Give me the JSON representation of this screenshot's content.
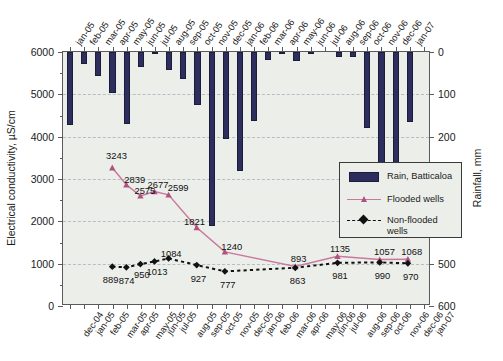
{
  "chart_data": {
    "type": "bar",
    "title": "",
    "ylabel": "Electrical conductivity, µS/cm",
    "y2label": "Rainfall, mm",
    "xlabel": "",
    "ylim": [
      0,
      6000
    ],
    "yticks": [
      "0",
      "1000",
      "2000",
      "3000",
      "4000",
      "5000",
      "6000"
    ],
    "y2lim": [
      0,
      600
    ],
    "y2ticks": [
      "0",
      "100",
      "200",
      "300",
      "400",
      "500",
      "600"
    ],
    "y2_inverted": true,
    "grid": true,
    "legend_position": "center-right",
    "categories": [
      "dec-04",
      "jan-05",
      "feb-05",
      "mar-05",
      "apr-05",
      "may-05",
      "jun-05",
      "jul-05",
      "aug-05",
      "sep-05",
      "oct-05",
      "nov-05",
      "dec-05",
      "jan-06",
      "feb-06",
      "mar-06",
      "apr-06",
      "may-06",
      "jun-06",
      "jul-06",
      "aug-06",
      "sep-06",
      "oct-06",
      "nov-06",
      "dec-06",
      "jan-07"
    ],
    "series": [
      {
        "name": "Rain, Batticaloa",
        "type": "bar",
        "axis": "y2",
        "units": "mm",
        "color": "#2e2e5e",
        "values": [
          172,
          28,
          57,
          98,
          170,
          36,
          4,
          43,
          64,
          125,
          410,
          205,
          280,
          162,
          18,
          3,
          22,
          1,
          0,
          12,
          12,
          180,
          297,
          325,
          166,
          0
        ]
      },
      {
        "name": "Flooded wells",
        "type": "line",
        "axis": "y1",
        "units": "µS/cm",
        "color": "#c9799f",
        "labels": [
          "3243",
          "2839",
          "2575",
          "2677",
          "2599",
          "1821",
          "1240",
          "893",
          "1135",
          "1057",
          "1068"
        ],
        "points": [
          {
            "category": "mar-05",
            "value": 3243,
            "label": "3243"
          },
          {
            "category": "apr-05",
            "value": 2839,
            "label": "2839"
          },
          {
            "category": "may-05",
            "value": 2575,
            "label": "2575"
          },
          {
            "category": "jun-05",
            "value": 2677,
            "label": "2677"
          },
          {
            "category": "jul-05",
            "value": 2599,
            "label": "2599"
          },
          {
            "category": "sep-05",
            "value": 1821,
            "label": "1821"
          },
          {
            "category": "nov-05",
            "value": 1240,
            "label": "1240"
          },
          {
            "category": "apr-06",
            "value": 893,
            "label": "893"
          },
          {
            "category": "jul-06",
            "value": 1135,
            "label": "1135"
          },
          {
            "category": "oct-06",
            "value": 1057,
            "label": "1057"
          },
          {
            "category": "dec-06",
            "value": 1068,
            "label": "1068"
          }
        ]
      },
      {
        "name": "Non-flooded wells",
        "type": "line-dashed",
        "axis": "y1",
        "units": "µS/cm",
        "color": "#111111",
        "labels": [
          "889",
          "874",
          "950",
          "1013",
          "1084",
          "927",
          "777",
          "863",
          "981",
          "990",
          "970"
        ],
        "points": [
          {
            "category": "mar-05",
            "value": 889,
            "label": "889"
          },
          {
            "category": "apr-05",
            "value": 874,
            "label": "874"
          },
          {
            "category": "may-05",
            "value": 950,
            "label": "950"
          },
          {
            "category": "jun-05",
            "value": 1013,
            "label": "1013"
          },
          {
            "category": "jul-05",
            "value": 1084,
            "label": "1084"
          },
          {
            "category": "sep-05",
            "value": 927,
            "label": "927"
          },
          {
            "category": "nov-05",
            "value": 777,
            "label": "777"
          },
          {
            "category": "apr-06",
            "value": 863,
            "label": "863"
          },
          {
            "category": "jul-06",
            "value": 981,
            "label": "981"
          },
          {
            "category": "oct-06",
            "value": 990,
            "label": "990"
          },
          {
            "category": "dec-06",
            "value": 970,
            "label": "970"
          }
        ]
      }
    ]
  },
  "legend": {
    "items": [
      {
        "label": "Rain, Batticaloa",
        "key": "bar-swatch"
      },
      {
        "label": "Flooded wells",
        "key": "line-marker"
      },
      {
        "label": "Non-flooded wells",
        "key": "dashed-marker"
      }
    ]
  },
  "colors": {
    "bar": "#2e2e5e",
    "flooded": "#c9799f",
    "nonflooded": "#111111",
    "plot_background": "#eceeea",
    "grid": "#b9bcc4",
    "axis": "#5a5a5a"
  }
}
